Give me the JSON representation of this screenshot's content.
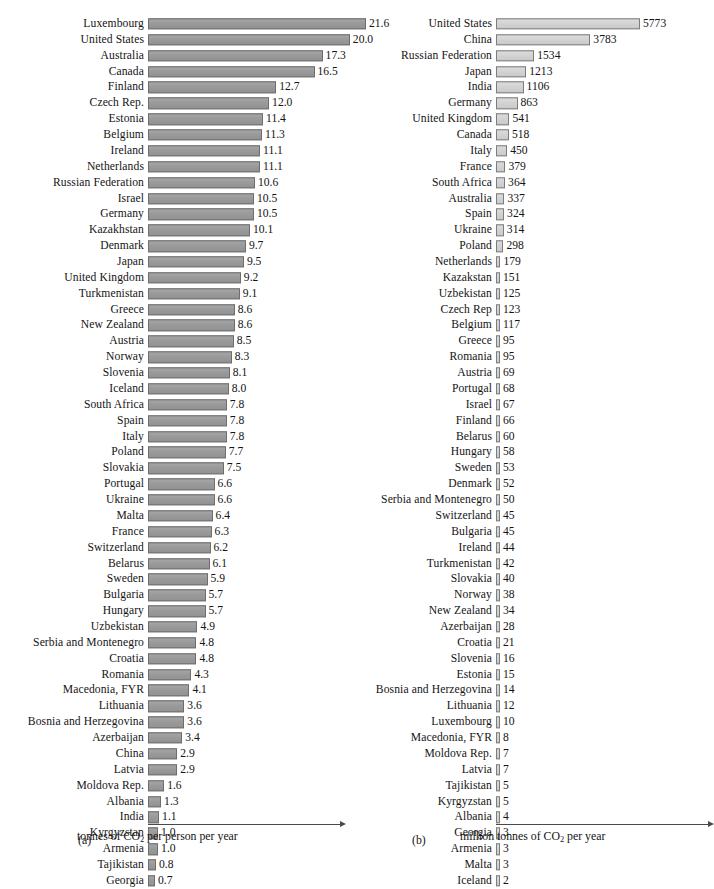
{
  "figure": {
    "panels": [
      {
        "tag": "(a)",
        "axis_caption_prefix": "tonnes of CO",
        "axis_caption_sub": "2",
        "axis_caption_suffix": " per person per year"
      },
      {
        "tag": "(b)",
        "axis_caption_prefix": "million tonnes of CO",
        "axis_caption_sub": "2",
        "axis_caption_suffix": " per year"
      }
    ]
  },
  "colors": {
    "bar_a_fill": "#9a9a9a",
    "bar_a_stroke": "#6e6e6e",
    "bar_b_fill": "#d2d2d2",
    "bar_b_stroke": "#7d7d7d",
    "axis": "#4a4a4a",
    "text": "#141414",
    "background": "#ffffff"
  },
  "chart_data": [
    {
      "type": "bar",
      "orientation": "horizontal",
      "panel": "(a)",
      "title": "",
      "xlabel": "tonnes of CO2 per person per year",
      "ylabel": "",
      "xlim": [
        0,
        21.6
      ],
      "grid": false,
      "legend": "none",
      "value_labels": true,
      "sorted": "descending",
      "categories": [
        "Luxembourg",
        "United States",
        "Australia",
        "Canada",
        "Finland",
        "Czech Rep.",
        "Estonia",
        "Belgium",
        "Ireland",
        "Netherlands",
        "Russian Federation",
        "Israel",
        "Germany",
        "Kazakhstan",
        "Denmark",
        "Japan",
        "United Kingdom",
        "Turkmenistan",
        "Greece",
        "New Zealand",
        "Austria",
        "Norway",
        "Slovenia",
        "Iceland",
        "South Africa",
        "Spain",
        "Italy",
        "Poland",
        "Slovakia",
        "Portugal",
        "Ukraine",
        "Malta",
        "France",
        "Switzerland",
        "Belarus",
        "Sweden",
        "Bulgaria",
        "Hungary",
        "Uzbekistan",
        "Serbia and Montenegro",
        "Croatia",
        "Romania",
        "Macedonia, FYR",
        "Lithuania",
        "Bosnia and Herzegovina",
        "Azerbaijan",
        "China",
        "Latvia",
        "Moldova Rep.",
        "Albania",
        "India",
        "Kyrgyzstan",
        "Armenia",
        "Tajikistan",
        "Georgia"
      ],
      "values": [
        21.6,
        20.0,
        17.3,
        16.5,
        12.7,
        12.0,
        11.4,
        11.3,
        11.1,
        11.1,
        10.6,
        10.5,
        10.5,
        10.1,
        9.7,
        9.5,
        9.2,
        9.1,
        8.6,
        8.6,
        8.5,
        8.3,
        8.1,
        8.0,
        7.8,
        7.8,
        7.8,
        7.7,
        7.5,
        6.6,
        6.6,
        6.4,
        6.3,
        6.2,
        6.1,
        5.9,
        5.7,
        5.7,
        4.9,
        4.8,
        4.8,
        4.3,
        4.1,
        3.6,
        3.6,
        3.4,
        2.9,
        2.9,
        1.6,
        1.3,
        1.1,
        1.0,
        1.0,
        0.8,
        0.7
      ],
      "labels": [
        "21.6",
        "20.0",
        "17.3",
        "16.5",
        "12.7",
        "12.0",
        "11.4",
        "11.3",
        "11.1",
        "11.1",
        "10.6",
        "10.5",
        "10.5",
        "10.1",
        "9.7",
        "9.5",
        "9.2",
        "9.1",
        "8.6",
        "8.6",
        "8.5",
        "8.3",
        "8.1",
        "8.0",
        "7.8",
        "7.8",
        "7.8",
        "7.7",
        "7.5",
        "6.6",
        "6.6",
        "6.4",
        "6.3",
        "6.2",
        "6.1",
        "5.9",
        "5.7",
        "5.7",
        "4.9",
        "4.8",
        "4.8",
        "4.3",
        "4.1",
        "3.6",
        "3.6",
        "3.4",
        "2.9",
        "2.9",
        "1.6",
        "1.3",
        "1.1",
        "1.0",
        "1.0",
        "0.8",
        "0.7"
      ]
    },
    {
      "type": "bar",
      "orientation": "horizontal",
      "panel": "(b)",
      "title": "",
      "xlabel": "million tonnes of CO2 per year",
      "ylabel": "",
      "xlim": [
        0,
        5773
      ],
      "grid": false,
      "legend": "none",
      "value_labels": true,
      "sorted": "descending",
      "categories": [
        "United States",
        "China",
        "Russian Federation",
        "Japan",
        "India",
        "Germany",
        "United Kingdom",
        "Canada",
        "Italy",
        "France",
        "South Africa",
        "Australia",
        "Spain",
        "Ukraine",
        "Poland",
        "Netherlands",
        "Kazakstan",
        "Uzbekistan",
        "Czech Rep",
        "Belgium",
        "Greece",
        "Romania",
        "Austria",
        "Portugal",
        "Israel",
        "Finland",
        "Belarus",
        "Hungary",
        "Sweden",
        "Denmark",
        "Serbia and Montenegro",
        "Switzerland",
        "Bulgaria",
        "Ireland",
        "Turkmenistan",
        "Slovakia",
        "Norway",
        "New Zealand",
        "Azerbaijan",
        "Croatia",
        "Slovenia",
        "Estonia",
        "Bosnia and Herzegovina",
        "Lithuania",
        "Luxembourg",
        "Macedonia, FYR",
        "Moldova Rep.",
        "Latvia",
        "Tajikistan",
        "Kyrgyzstan",
        "Albania",
        "Georgia",
        "Armenia",
        "Malta",
        "Iceland"
      ],
      "values": [
        5773,
        3783,
        1534,
        1213,
        1106,
        863,
        541,
        518,
        450,
        379,
        364,
        337,
        324,
        314,
        298,
        179,
        151,
        125,
        123,
        117,
        95,
        95,
        69,
        68,
        67,
        66,
        60,
        58,
        53,
        52,
        50,
        45,
        45,
        44,
        42,
        40,
        38,
        34,
        28,
        21,
        16,
        15,
        14,
        12,
        10,
        8,
        7,
        7,
        5,
        5,
        4,
        3,
        3,
        3,
        2
      ],
      "labels": [
        "5773",
        "3783",
        "1534",
        "1213",
        "1106",
        "863",
        "541",
        "518",
        "450",
        "379",
        "364",
        "337",
        "324",
        "314",
        "298",
        "179",
        "151",
        "125",
        "123",
        "117",
        "95",
        "95",
        "69",
        "68",
        "67",
        "66",
        "60",
        "58",
        "53",
        "52",
        "50",
        "45",
        "45",
        "44",
        "42",
        "40",
        "38",
        "34",
        "28",
        "21",
        "16",
        "15",
        "14",
        "12",
        "10",
        "8",
        "7",
        "7",
        "5",
        "5",
        "4",
        "3",
        "3",
        "3",
        "2"
      ]
    }
  ]
}
